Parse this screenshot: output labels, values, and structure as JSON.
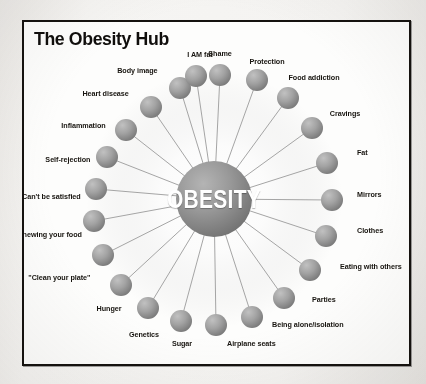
{
  "figure": {
    "title": "The Obesity Hub",
    "center_label": "OBESITY",
    "palette": {
      "frame_border": "#15120f",
      "page_background": "#f2f1ef",
      "figure_background": "#fdfdfc",
      "sphere_dark": "#7b7b7b",
      "sphere_light": "#bdbdbd",
      "center_sphere_dark": "#7a7a7a",
      "center_sphere_light": "#b4b4b4",
      "ray_line": "#9b9b9b",
      "text": "#17140f",
      "center_text": "#ffffff"
    }
  },
  "chart_data": {
    "type": "diagram",
    "layout": "radial-hub-and-spoke",
    "title": "The Obesity Hub",
    "hub": {
      "label": "OBESITY",
      "cx": 190,
      "cy": 177,
      "r": 38
    },
    "node_radius": 11,
    "nodes": [
      {
        "label": "Shame",
        "angle_deg": -90,
        "cx": 196,
        "cy": 53,
        "label_x": 196,
        "label_y": 32,
        "align": "center"
      },
      {
        "label": "Protection",
        "angle_deg": -72,
        "cx": 233,
        "cy": 58,
        "label_x": 243,
        "label_y": 40,
        "align": "center"
      },
      {
        "label": "Food addiction",
        "angle_deg": -54,
        "cx": 264,
        "cy": 76,
        "label_x": 290,
        "label_y": 56,
        "align": "center"
      },
      {
        "label": "Cravings",
        "angle_deg": -36,
        "cx": 288,
        "cy": 106,
        "label_x": 321,
        "label_y": 92,
        "align": "center"
      },
      {
        "label": "Fat",
        "angle_deg": -18,
        "cx": 303,
        "cy": 141,
        "label_x": 333,
        "label_y": 131,
        "align": "left"
      },
      {
        "label": "Mirrors",
        "angle_deg": 0,
        "cx": 308,
        "cy": 178,
        "label_x": 333,
        "label_y": 173,
        "align": "left"
      },
      {
        "label": "Clothes",
        "angle_deg": 18,
        "cx": 302,
        "cy": 214,
        "label_x": 333,
        "label_y": 209,
        "align": "left"
      },
      {
        "label": "Eating with others",
        "angle_deg": 36,
        "cx": 286,
        "cy": 248,
        "label_x": 316,
        "label_y": 245,
        "align": "left"
      },
      {
        "label": "Parties",
        "angle_deg": 54,
        "cx": 260,
        "cy": 276,
        "label_x": 288,
        "label_y": 278,
        "align": "left"
      },
      {
        "label": "Being alone/isolation",
        "angle_deg": 72,
        "cx": 228,
        "cy": 295,
        "label_x": 248,
        "label_y": 303,
        "align": "left"
      },
      {
        "label": "Airplane seats",
        "angle_deg": 90,
        "cx": 192,
        "cy": 303,
        "label_x": 203,
        "label_y": 322,
        "align": "left"
      },
      {
        "label": "Sugar",
        "angle_deg": 108,
        "cx": 157,
        "cy": 299,
        "label_x": 158,
        "label_y": 322,
        "align": "center"
      },
      {
        "label": "Genetics",
        "angle_deg": 126,
        "cx": 124,
        "cy": 286,
        "label_x": 120,
        "label_y": 313,
        "align": "center"
      },
      {
        "label": "Hunger",
        "angle_deg": 144,
        "cx": 97,
        "cy": 263,
        "label_x": 85,
        "label_y": 287,
        "align": "center"
      },
      {
        "label": "\"Clean your plate\"",
        "angle_deg": 162,
        "cx": 79,
        "cy": 233,
        "label_x": 66,
        "label_y": 256,
        "align": "right"
      },
      {
        "label": "Chewing your food",
        "angle_deg": 180,
        "cx": 70,
        "cy": 199,
        "label_x": 58,
        "label_y": 213,
        "align": "right"
      },
      {
        "label": "Can't be satisfied",
        "angle_deg": 198,
        "cx": 72,
        "cy": 167,
        "label_x": 57,
        "label_y": 175,
        "align": "right"
      },
      {
        "label": "Self-rejection",
        "angle_deg": 216,
        "cx": 83,
        "cy": 135,
        "label_x": 66,
        "label_y": 138,
        "align": "right"
      },
      {
        "label": "Inflammation",
        "angle_deg": 234,
        "cx": 102,
        "cy": 108,
        "label_x": 82,
        "label_y": 104,
        "align": "right"
      },
      {
        "label": "Heart disease",
        "angle_deg": 252,
        "cx": 127,
        "cy": 85,
        "label_x": 105,
        "label_y": 72,
        "align": "right"
      },
      {
        "label": "Body image",
        "angle_deg": 270,
        "cx": 156,
        "cy": 66,
        "label_x": 134,
        "label_y": 49,
        "align": "right"
      },
      {
        "label": "I AM fat",
        "angle_deg": 288,
        "cx": 172,
        "cy": 54,
        "label_x": 176,
        "label_y": 33,
        "align": "center"
      }
    ]
  }
}
